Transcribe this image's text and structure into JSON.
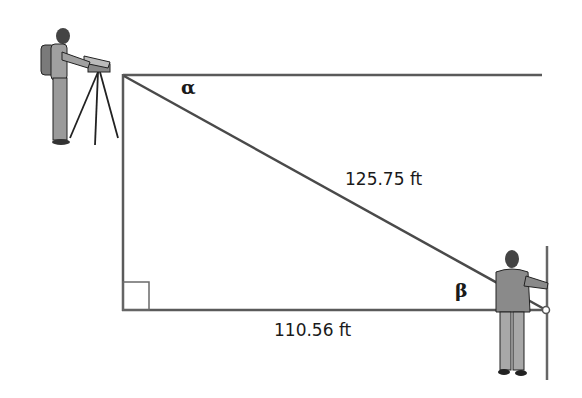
{
  "diagram": {
    "type": "right-triangle-surveying",
    "labels": {
      "hypotenuse": "125.75 ft",
      "base": "110.56 ft",
      "angle_top": "α",
      "angle_right": "β"
    },
    "figures": {
      "surveyor_left": "surveyor-with-tripod",
      "person_right": "person-holding-survey-pole"
    },
    "colors": {
      "line": "#555555",
      "text": "#1a1a1a",
      "figure_fill": "#9a9a9a",
      "figure_dark": "#3a3a3a"
    }
  }
}
